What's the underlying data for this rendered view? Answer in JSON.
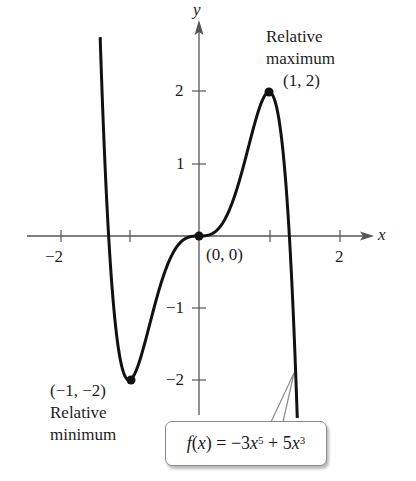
{
  "chart_data": {
    "type": "line",
    "title": "",
    "function": "f(x) = -3x^5 + 5x^3",
    "xlabel": "x",
    "ylabel": "y",
    "xlim": [
      -2.5,
      2.6
    ],
    "ylim": [
      -2.5,
      3.0
    ],
    "x_ticks": [
      -2,
      -1,
      0,
      1,
      2
    ],
    "x_tick_labels": [
      "-2",
      "",
      "",
      "",
      "2"
    ],
    "y_ticks": [
      -2,
      -1,
      1,
      2
    ],
    "y_tick_labels": [
      "-2",
      "-1",
      "1",
      "2"
    ],
    "grid": false,
    "series": [
      {
        "name": "f(x) = -3x^5 + 5x^3",
        "x": [
          -1.41,
          -1.3,
          -1.2,
          -1.1,
          -1.0,
          -0.9,
          -0.8,
          -0.6,
          -0.4,
          -0.2,
          0,
          0.2,
          0.4,
          0.6,
          0.8,
          0.9,
          1.0,
          1.1,
          1.2,
          1.3,
          1.4
        ],
        "y": [
          2.79,
          1.85,
          1.11,
          0.48,
          -2.0,
          -1.87,
          -1.58,
          -0.85,
          -0.29,
          -0.04,
          0,
          0.04,
          0.29,
          0.85,
          1.58,
          1.87,
          2.0,
          -0.48,
          -1.11,
          -1.85,
          -2.41
        ]
      }
    ],
    "points": [
      {
        "x": 1,
        "y": 2,
        "label": "(1, 2)",
        "note": "Relative maximum"
      },
      {
        "x": 0,
        "y": 0,
        "label": "(0, 0)",
        "note": ""
      },
      {
        "x": -1,
        "y": -2,
        "label": "(-1, -2)",
        "note": "Relative minimum"
      }
    ]
  },
  "labels": {
    "axis_x": "x",
    "axis_y": "y",
    "tick_x_neg2": "−2",
    "tick_x_2": "2",
    "tick_y_2": "2",
    "tick_y_1": "1",
    "tick_y_neg1": "−1",
    "tick_y_neg2": "−2",
    "max_line1": "Relative",
    "max_line2": "maximum",
    "max_point": "(1, 2)",
    "origin_point": "(0, 0)",
    "min_point": "(−1, −2)",
    "min_line1": "Relative",
    "min_line2": "minimum"
  },
  "callout": {
    "f": "f",
    "open": "(",
    "x": "x",
    "close_eq": ") = −3",
    "x2": "x",
    "exp1": "5",
    "plus": " + 5",
    "x3": "x",
    "exp2": "3"
  },
  "colors": {
    "curve": "#111111",
    "axis": "#555555",
    "callout_border": "#8a8a8a"
  }
}
